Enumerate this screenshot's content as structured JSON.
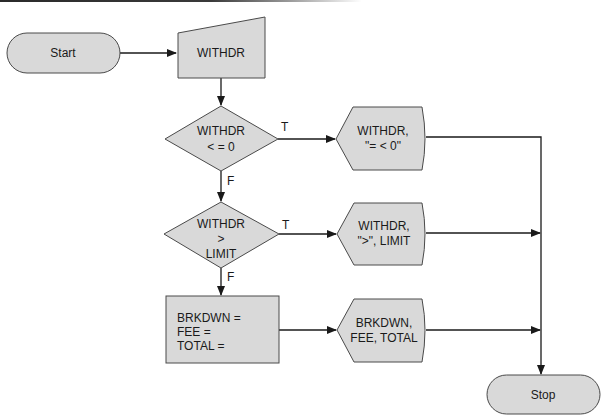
{
  "diagram": {
    "type": "flowchart",
    "nodes": {
      "start": {
        "shape": "terminator",
        "label": "Start"
      },
      "input": {
        "shape": "manual-input",
        "label": "WITHDR"
      },
      "decision1": {
        "shape": "decision",
        "lines": [
          "WITHDR",
          "< = 0"
        ]
      },
      "display1": {
        "shape": "display",
        "lines": [
          "WITHDR,",
          "\"= < 0\""
        ]
      },
      "decision2": {
        "shape": "decision",
        "lines": [
          "WITHDR",
          ">",
          "LIMIT"
        ]
      },
      "display2": {
        "shape": "display",
        "lines": [
          "WITHDR,",
          "\">\", LIMIT"
        ]
      },
      "process": {
        "shape": "process",
        "lines": [
          "BRKDWN =",
          "FEE =",
          "TOTAL ="
        ]
      },
      "display3": {
        "shape": "display",
        "lines": [
          "BRKDWN,",
          "FEE, TOTAL"
        ]
      },
      "stop": {
        "shape": "terminator",
        "label": "Stop"
      }
    },
    "edge_labels": {
      "d1_true": "T",
      "d1_false": "F",
      "d2_true": "T",
      "d2_false": "F"
    },
    "edges": [
      {
        "from": "start",
        "to": "input"
      },
      {
        "from": "input",
        "to": "decision1"
      },
      {
        "from": "decision1",
        "to": "display1",
        "label": "T"
      },
      {
        "from": "decision1",
        "to": "decision2",
        "label": "F"
      },
      {
        "from": "decision2",
        "to": "display2",
        "label": "T"
      },
      {
        "from": "decision2",
        "to": "process",
        "label": "F"
      },
      {
        "from": "process",
        "to": "display3"
      },
      {
        "from": "display1",
        "to": "stop"
      },
      {
        "from": "display2",
        "to": "stop"
      },
      {
        "from": "display3",
        "to": "stop"
      }
    ],
    "colors": {
      "fill": "#d9d9d9",
      "stroke": "#4a4a4a",
      "line": "#1a1a1a"
    }
  }
}
